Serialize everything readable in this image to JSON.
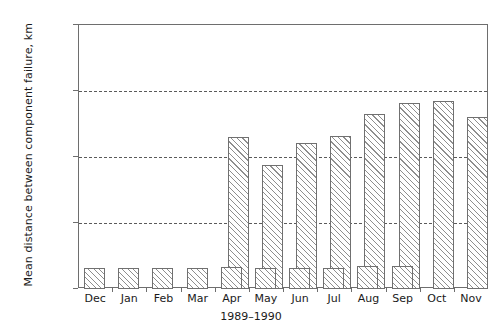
{
  "chart_data": {
    "type": "bar",
    "title": "",
    "xlabel": "1989–1990",
    "ylabel": "Mean distance between component failure, km",
    "categories": [
      "Dec",
      "Jan",
      "Feb",
      "Mar",
      "Apr",
      "May",
      "Jun",
      "Jul",
      "Aug",
      "Sep",
      "Oct",
      "Nov"
    ],
    "ylim": [
      0,
      32000
    ],
    "yticks": [
      0,
      8000,
      16000,
      24000,
      32000
    ],
    "ytick_labels": [
      "0",
      "8,000",
      "16,000",
      "24,000",
      "32,000"
    ],
    "grid": "horizontal-dashed",
    "legend": "none",
    "series": [
      {
        "name": "tall-series",
        "values": [
          null,
          null,
          null,
          null,
          18400,
          15000,
          17700,
          18500,
          21200,
          22500,
          22800,
          20800
        ]
      },
      {
        "name": "short-series",
        "values": [
          2550,
          2550,
          2550,
          2550,
          2700,
          2600,
          2600,
          2600,
          2750,
          2750,
          null,
          null
        ]
      }
    ]
  },
  "axis": {
    "y_title": "Mean distance between component failure, km",
    "x_title": "1989–1990"
  },
  "colors": {
    "frame": "#6e6e6e",
    "grid": "#5a5a5a",
    "bar_edge": "#707070",
    "bar_hatch": "#8e8e8e",
    "text": "#1a1a1a",
    "background": "#ffffff"
  }
}
